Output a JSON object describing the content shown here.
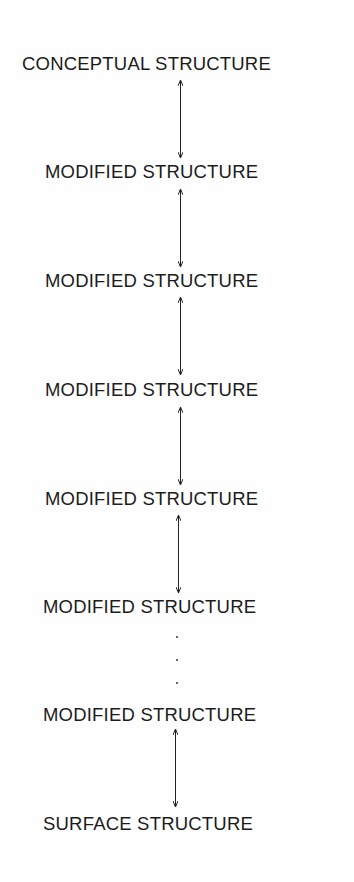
{
  "diagram": {
    "type": "vertical-chain",
    "nodes": [
      {
        "label": "CONCEPTUAL STRUCTURE"
      },
      {
        "label": "MODIFIED STRUCTURE"
      },
      {
        "label": "MODIFIED STRUCTURE"
      },
      {
        "label": "MODIFIED STRUCTURE"
      },
      {
        "label": "MODIFIED STRUCTURE"
      },
      {
        "label": "MODIFIED STRUCTURE"
      },
      {
        "label": "MODIFIED STRUCTURE"
      },
      {
        "label": "SURFACE STRUCTURE"
      }
    ],
    "edges": [
      {
        "from": 0,
        "to": 1,
        "style": "bidirectional-arrow"
      },
      {
        "from": 1,
        "to": 2,
        "style": "bidirectional-arrow"
      },
      {
        "from": 2,
        "to": 3,
        "style": "bidirectional-arrow"
      },
      {
        "from": 3,
        "to": 4,
        "style": "bidirectional-arrow"
      },
      {
        "from": 4,
        "to": 5,
        "style": "bidirectional-arrow"
      },
      {
        "from": 5,
        "to": 6,
        "style": "ellipsis-dots"
      },
      {
        "from": 6,
        "to": 7,
        "style": "bidirectional-arrow"
      }
    ]
  }
}
